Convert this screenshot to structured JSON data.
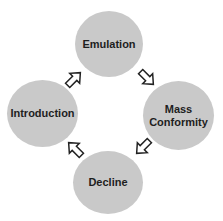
{
  "diagram": {
    "type": "cycle",
    "top_caption_fragment": "",
    "colors": {
      "node_fill": "#c9c9c9",
      "node_text": "#1e1e1e",
      "arrow_stroke": "#222222",
      "arrow_fill": "#ffffff",
      "background": "#ffffff"
    },
    "nodes": [
      {
        "id": "emulation",
        "label": "Emulation"
      },
      {
        "id": "mass-conformity",
        "label_line1": "Mass",
        "label_line2": "Conformity"
      },
      {
        "id": "decline",
        "label": "Decline"
      },
      {
        "id": "introduction",
        "label": "Introduction"
      }
    ],
    "edges": [
      {
        "from": "Introduction",
        "to": "Emulation",
        "direction": "up-right"
      },
      {
        "from": "Emulation",
        "to": "Mass Conformity",
        "direction": "down-right"
      },
      {
        "from": "Mass Conformity",
        "to": "Decline",
        "direction": "down-left"
      },
      {
        "from": "Decline",
        "to": "Introduction",
        "direction": "up-left"
      }
    ]
  }
}
